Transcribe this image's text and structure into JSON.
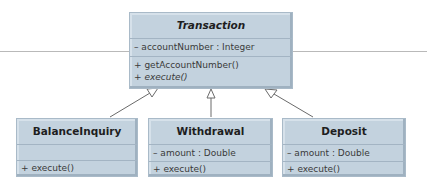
{
  "diagram": {
    "type": "UML class diagram (inheritance)",
    "superclass": {
      "name": "Transaction",
      "name_style": "bold-italic",
      "attributes": [
        "– accountNumber : Integer"
      ],
      "operations": [
        {
          "text": "+ getAccountNumber()",
          "italic": false
        },
        {
          "text": "+ execute()",
          "italic": true
        }
      ]
    },
    "subclasses": [
      {
        "name": "BalanceInquiry",
        "attributes": [],
        "operations": [
          {
            "text": "+ execute()"
          }
        ]
      },
      {
        "name": "Withdrawal",
        "attributes": [
          "– amount : Double"
        ],
        "operations": [
          {
            "text": "+ execute()"
          }
        ]
      },
      {
        "name": "Deposit",
        "attributes": [
          "– amount : Double"
        ],
        "operations": [
          {
            "text": "+ execute()"
          }
        ]
      }
    ],
    "relationship": "generalization (hollow triangle arrows point to Transaction)",
    "colors": {
      "box_fill": "#c3d2de",
      "box_border": "#a9bac8",
      "arrow": "#6a6a6a",
      "background": "#ffffff"
    }
  }
}
